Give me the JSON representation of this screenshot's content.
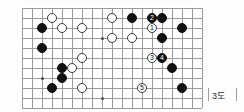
{
  "diagram": {
    "caption": "3도",
    "kind": "go-board-diagram",
    "board": {
      "cols": 18,
      "rows": 10,
      "spacing_px": 10,
      "origin_x_px": 22,
      "origin_y_px": 8,
      "line_color": "#9a9a9a",
      "frame_color": "#c9c9c9",
      "background": "#ffffff"
    },
    "colors": {
      "black_stone": "#111111",
      "white_stone": "#ffffff",
      "stone_outline": "#3a3a3a",
      "caption_text": "#2b2b2b"
    },
    "hoshi": [
      {
        "col": 2,
        "row": 7
      },
      {
        "col": 8,
        "row": 3
      },
      {
        "col": 8,
        "row": 9
      },
      {
        "col": 14,
        "row": 3
      }
    ],
    "stones": [
      {
        "id": "w-a",
        "color": "white",
        "col": 3,
        "row": 1,
        "label": ""
      },
      {
        "id": "b-a",
        "color": "black",
        "col": 2,
        "row": 2,
        "label": ""
      },
      {
        "id": "w-b",
        "color": "white",
        "col": 4,
        "row": 2,
        "label": ""
      },
      {
        "id": "w-c",
        "color": "white",
        "col": 6,
        "row": 2,
        "label": ""
      },
      {
        "id": "w-d",
        "color": "white",
        "col": 9,
        "row": 1,
        "label": ""
      },
      {
        "id": "b-b",
        "color": "black",
        "col": 11,
        "row": 1,
        "label": ""
      },
      {
        "id": "b-c",
        "color": "black",
        "col": 13,
        "row": 1,
        "label": "2"
      },
      {
        "id": "b-d",
        "color": "black",
        "col": 14,
        "row": 1,
        "label": ""
      },
      {
        "id": "w-e",
        "color": "white",
        "col": 13,
        "row": 2,
        "label": "1"
      },
      {
        "id": "b-e",
        "color": "black",
        "col": 16,
        "row": 2,
        "label": ""
      },
      {
        "id": "w-f",
        "color": "white",
        "col": 9,
        "row": 3,
        "label": ""
      },
      {
        "id": "w-g",
        "color": "white",
        "col": 11,
        "row": 3,
        "label": ""
      },
      {
        "id": "b-f",
        "color": "black",
        "col": 14,
        "row": 3,
        "label": ""
      },
      {
        "id": "b-g",
        "color": "black",
        "col": 2,
        "row": 4,
        "label": ""
      },
      {
        "id": "w-h",
        "color": "white",
        "col": 6,
        "row": 5,
        "label": ""
      },
      {
        "id": "w-i",
        "color": "white",
        "col": 13,
        "row": 5,
        "label": "3"
      },
      {
        "id": "b-h",
        "color": "black",
        "col": 14,
        "row": 5,
        "label": "4"
      },
      {
        "id": "b-i",
        "color": "black",
        "col": 4,
        "row": 6,
        "label": ""
      },
      {
        "id": "w-j",
        "color": "white",
        "col": 5,
        "row": 6,
        "label": ""
      },
      {
        "id": "b-j",
        "color": "black",
        "col": 15,
        "row": 6,
        "label": ""
      },
      {
        "id": "b-k",
        "color": "black",
        "col": 4,
        "row": 7,
        "label": ""
      },
      {
        "id": "b-l",
        "color": "black",
        "col": 3,
        "row": 8,
        "label": ""
      },
      {
        "id": "w-k",
        "color": "white",
        "col": 6,
        "row": 8,
        "label": ""
      },
      {
        "id": "w-l",
        "color": "white",
        "col": 12,
        "row": 8,
        "label": "5"
      },
      {
        "id": "b-m",
        "color": "black",
        "col": 16,
        "row": 8,
        "label": ""
      }
    ],
    "moves": [
      {
        "number": "1",
        "color": "white"
      },
      {
        "number": "2",
        "color": "black"
      },
      {
        "number": "3",
        "color": "white"
      },
      {
        "number": "4",
        "color": "black"
      },
      {
        "number": "5",
        "color": "white"
      }
    ]
  }
}
